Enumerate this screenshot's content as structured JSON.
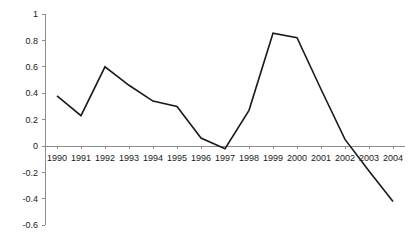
{
  "chart_data": {
    "type": "line",
    "title": "",
    "subtitle": "",
    "xlabel": "",
    "ylabel": "",
    "categories": [
      "1990",
      "1991",
      "1992",
      "1993",
      "1994",
      "1995",
      "1996",
      "1997",
      "1998",
      "1999",
      "2000",
      "2001",
      "2002",
      "2003",
      "2004"
    ],
    "values": [
      0.38,
      0.23,
      0.6,
      0.46,
      0.34,
      0.3,
      0.06,
      -0.02,
      0.27,
      0.855,
      0.82,
      0.43,
      0.05,
      -0.19,
      -0.42
    ],
    "series": [
      {
        "name": "",
        "values": [
          0.38,
          0.23,
          0.6,
          0.46,
          0.34,
          0.3,
          0.06,
          -0.02,
          0.27,
          0.855,
          0.82,
          0.43,
          0.05,
          -0.19,
          -0.42
        ]
      }
    ],
    "ylim": [
      -0.6,
      1.0
    ],
    "yticks": [
      1,
      0.8,
      0.6,
      0.4,
      0.2,
      0,
      -0.2,
      -0.4,
      -0.6
    ],
    "ytick_labels": [
      "1",
      "0.8",
      "0.6",
      "0.4",
      "0.2",
      "0",
      "-0.2",
      "-0.4",
      "-0.6"
    ],
    "xtick_labels": [
      "1990",
      "1991",
      "1992",
      "1993",
      "1994",
      "1995",
      "1996",
      "1997",
      "1998",
      "1999",
      "2000",
      "2001",
      "2002",
      "2003",
      "2004"
    ],
    "grid": false,
    "legend": null,
    "legend_position": "none",
    "annotations": [],
    "line_color": "#1a1a1a",
    "axis_color": "#8c8c8c",
    "background_color": "#ffffff"
  }
}
